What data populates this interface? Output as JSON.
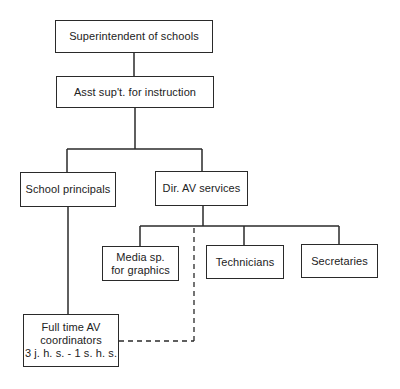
{
  "diagram": {
    "type": "org-chart",
    "nodes": [
      {
        "id": "superintendent",
        "label": "Superintendent of schools"
      },
      {
        "id": "asst_supt",
        "label": "Asst sup't. for instruction"
      },
      {
        "id": "principals",
        "label": "School principals"
      },
      {
        "id": "dir_av",
        "label": "Dir. AV services"
      },
      {
        "id": "media_sp",
        "label": "Media sp.\nfor graphics"
      },
      {
        "id": "technicians",
        "label": "Technicians"
      },
      {
        "id": "secretaries",
        "label": "Secretaries"
      },
      {
        "id": "av_coordinators",
        "label": "Full time AV\ncoordinators\n3 j. h. s. - 1 s. h. s."
      }
    ],
    "edges": [
      {
        "from": "superintendent",
        "to": "asst_supt",
        "style": "solid"
      },
      {
        "from": "asst_supt",
        "to": "principals",
        "style": "solid"
      },
      {
        "from": "asst_supt",
        "to": "dir_av",
        "style": "solid"
      },
      {
        "from": "dir_av",
        "to": "media_sp",
        "style": "solid"
      },
      {
        "from": "dir_av",
        "to": "technicians",
        "style": "solid"
      },
      {
        "from": "dir_av",
        "to": "secretaries",
        "style": "solid"
      },
      {
        "from": "principals",
        "to": "av_coordinators",
        "style": "solid"
      },
      {
        "from": "dir_av",
        "to": "av_coordinators",
        "style": "dashed"
      }
    ]
  }
}
